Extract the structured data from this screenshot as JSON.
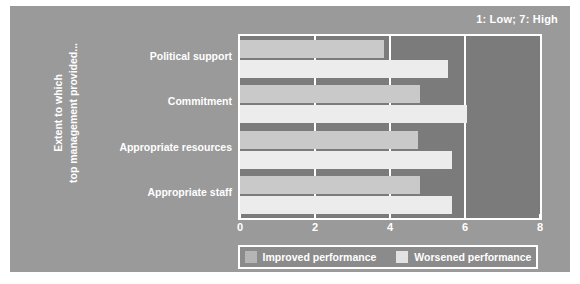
{
  "figure": {
    "scale_note": "1: Low; 7: High",
    "y_axis_title_line1": "Extent to which",
    "y_axis_title_line2": "top management provided...",
    "colors": {
      "panel_background": "#9a9a9a",
      "plot_background": "#7b7b7b",
      "axis_and_text": "#ffffff",
      "improved_bar": "#c9c9c9",
      "worsened_bar": "#ececec",
      "legend_background": "#8b8b8b"
    }
  },
  "legend": {
    "position": "bottom",
    "items": [
      {
        "label": "Improved performance",
        "swatch": "improved"
      },
      {
        "label": "Worsened performance",
        "swatch": "worsened"
      }
    ]
  },
  "chart_data": {
    "type": "bar",
    "orientation": "horizontal",
    "title": "",
    "subtitle": "",
    "annotation": "1: Low; 7: High",
    "xlabel": "",
    "ylabel": "Extent to which top management provided...",
    "xlim": [
      0,
      8
    ],
    "ylim": null,
    "xticks": [
      0,
      2,
      4,
      6,
      8
    ],
    "xtick_labels": [
      "0",
      "2",
      "4",
      "6",
      "8"
    ],
    "grid": true,
    "grid_axis": "x",
    "categories": [
      "Political support",
      "Commitment",
      "Appropriate resources",
      "Appropriate staff"
    ],
    "series": [
      {
        "name": "Improved performance",
        "color": "#c9c9c9",
        "values": [
          3.85,
          4.8,
          4.75,
          4.8
        ]
      },
      {
        "name": "Worsened performance",
        "color": "#ececec",
        "values": [
          5.55,
          6.05,
          5.65,
          5.65
        ]
      }
    ]
  }
}
